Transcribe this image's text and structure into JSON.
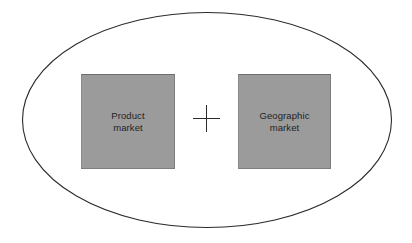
{
  "diagram": {
    "shapes": {
      "outer_ellipse": {
        "name": "relevant-market-ellipse",
        "stroke_color": "#2b2b2b",
        "fill_color": "#ffffff",
        "stroke_width": 1.1,
        "center_x": 207,
        "center_y": 120,
        "radius_x": 185,
        "radius_y": 108
      },
      "plus_operator": {
        "symbol": "+",
        "color": "#2b2b2b",
        "name": "plus-sign"
      }
    },
    "boxes": [
      {
        "id": "product-market",
        "label": "Product\nmarket",
        "line1": "Product",
        "line2": "market",
        "fill_color": "#9b9b9b",
        "border_color": "#7d7d7d",
        "text_color": "#232323"
      },
      {
        "id": "geographic-market",
        "label": "Geographic\nmarket",
        "line1": "Geographic",
        "line2": "market",
        "fill_color": "#9b9b9b",
        "border_color": "#7d7d7d",
        "text_color": "#232323"
      }
    ],
    "background_color": "#ffffff"
  }
}
